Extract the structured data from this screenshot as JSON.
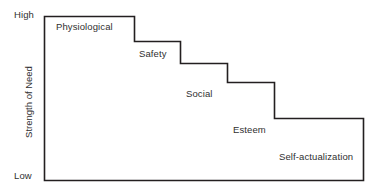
{
  "chart_data": {
    "type": "bar",
    "title": "",
    "subtitle": "",
    "xlabel": "",
    "ylabel": "Strength of Need",
    "grid": false,
    "legend": null,
    "axis": {
      "y_title": "Strength of Need",
      "y_ticks": [
        "High",
        "Low"
      ],
      "y_tick_high": "High",
      "y_tick_low": "Low",
      "y_range_labels": [
        "Low",
        "High"
      ],
      "x_ticks": []
    },
    "categories": [
      "Physiological",
      "Safety",
      "Social",
      "Esteem",
      "Self-actualization"
    ],
    "values": [
      5,
      4,
      3,
      2,
      1
    ],
    "ylim": [
      0,
      5
    ],
    "steps": [
      {
        "label": "Physiological",
        "rank": 1,
        "strength": 5,
        "x0": 44,
        "x1": 134,
        "y": 16
      },
      {
        "label": "Safety",
        "rank": 2,
        "strength": 4,
        "x0": 134,
        "x1": 180,
        "y": 41
      },
      {
        "label": "Social",
        "rank": 3,
        "strength": 3,
        "x0": 180,
        "x1": 227,
        "y": 63
      },
      {
        "label": "Esteem",
        "rank": 4,
        "strength": 2,
        "x0": 227,
        "x1": 274,
        "y": 82
      },
      {
        "label": "Self-actualization",
        "rank": 5,
        "strength": 1,
        "x0": 274,
        "x1": 363,
        "y": 118
      }
    ],
    "colors": {
      "stroke": "#231f20",
      "text": "#2f2f2f",
      "background": "#ffffff"
    }
  },
  "labels": {
    "y_axis_title": "Strength of Need",
    "tick_high": "High",
    "tick_low": "Low",
    "step_0": "Physiological",
    "step_1": "Safety",
    "step_2": "Social",
    "step_3": "Esteem",
    "step_4": "Self-actualization"
  }
}
